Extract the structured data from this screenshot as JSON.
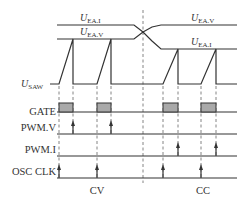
{
  "diagram": {
    "signals": {
      "u_ea_i": {
        "main": "U",
        "sub": "EA.I"
      },
      "u_ea_v": {
        "main": "U",
        "sub": "EA.V"
      },
      "u_saw": {
        "main": "U",
        "sub": "SAW"
      },
      "gate": "GATE",
      "pwm_v": "PWM.V",
      "pwm_i": "PWM.I",
      "osc_clk": "OSC CLK"
    },
    "modes": {
      "left": "CV",
      "right": "CC"
    },
    "colors": {
      "line": "#333333",
      "pulse_fill": "#a9a9a9",
      "dash": "#666666",
      "background": "#ffffff"
    }
  }
}
